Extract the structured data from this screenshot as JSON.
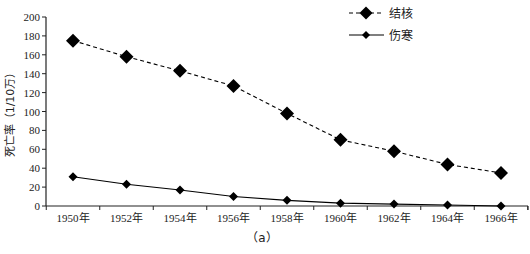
{
  "chart_data": {
    "type": "line",
    "title": "",
    "caption": "（a）",
    "xlabel": "",
    "ylabel": "死亡率（1/10万）",
    "x": [
      "1950年",
      "1952年",
      "1954年",
      "1956年",
      "1958年",
      "1960年",
      "1962年",
      "1964年",
      "1966年"
    ],
    "ylim": [
      0,
      200
    ],
    "yticks": [
      0,
      20,
      40,
      60,
      80,
      100,
      120,
      140,
      160,
      180,
      200
    ],
    "grid": false,
    "legend_position": "top-right",
    "series": [
      {
        "name": "结核",
        "line_style": "dashed",
        "marker": "large-diamond",
        "color": "#000000",
        "values": [
          175,
          158,
          143,
          127,
          98,
          70,
          58,
          44,
          35
        ]
      },
      {
        "name": "伤寒",
        "line_style": "solid",
        "marker": "small-diamond",
        "color": "#000000",
        "values": [
          31,
          23,
          17,
          10,
          6,
          3,
          2,
          1,
          0
        ]
      }
    ]
  }
}
